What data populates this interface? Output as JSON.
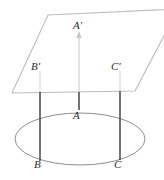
{
  "figure": {
    "name": "line-perpendicular-to-plane-diagram",
    "background_color": "#ffffff",
    "width": 164,
    "height": 180,
    "colors": {
      "plane_stroke": "#b9b9b9",
      "ellipse_stroke": "#8a8a8a",
      "segment_dark": "#3a3a3a",
      "segment_light": "#c2c2c2",
      "label_text": "#2b2b2b"
    },
    "labels": {
      "a_prime": "A′",
      "b_prime": "B′",
      "c_prime": "C′",
      "a": "A",
      "b": "B",
      "c": "C"
    },
    "shapes": {
      "plane": {
        "type": "parallelogram",
        "points": "48,15 178,9 135,91 12,93"
      },
      "ellipse": {
        "type": "ellipse",
        "cx": 80,
        "cy": 139,
        "rx": 65,
        "ry": 26
      },
      "segments": [
        {
          "name": "segment-a-upper",
          "x": 79,
          "y1": 33,
          "y2": 91,
          "shade": "light",
          "arrow": true
        },
        {
          "name": "segment-a-lower",
          "x": 79,
          "y1": 91,
          "y2": 110,
          "shade": "dark",
          "arrow": false
        },
        {
          "name": "segment-b",
          "x": 40,
          "y1": 72,
          "y2": 160,
          "shade": "mixed",
          "arrow": false
        },
        {
          "name": "segment-c",
          "x": 120,
          "y1": 72,
          "y2": 160,
          "shade": "mixed",
          "arrow": false
        }
      ]
    }
  }
}
